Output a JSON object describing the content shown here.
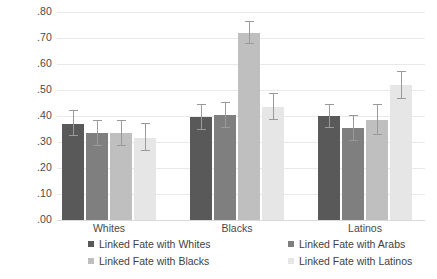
{
  "chart_data": {
    "type": "bar",
    "title": "",
    "subtitle": "",
    "xlabel": "",
    "ylabel": "",
    "ylim": [
      0.0,
      0.8
    ],
    "grid": true,
    "legend_position": "bottom",
    "categories": [
      "Whites",
      "Blacks",
      "Latinos"
    ],
    "ytick_labels": [
      ".80",
      ".70",
      ".60",
      ".50",
      ".40",
      ".30",
      ".20",
      ".10",
      ".00"
    ],
    "ytick_values": [
      0.8,
      0.7,
      0.6,
      0.5,
      0.4,
      0.3,
      0.2,
      0.1,
      0.0
    ],
    "series": [
      {
        "name": "Linked Fate with Whites",
        "color": "#595959",
        "values": [
          0.37,
          0.395,
          0.4
        ],
        "err_low": [
          0.325,
          0.345,
          0.355
        ],
        "err_high": [
          0.425,
          0.445,
          0.445
        ]
      },
      {
        "name": "Linked Fate with Arabs",
        "color": "#7f7f7f",
        "values": [
          0.335,
          0.405,
          0.355
        ],
        "err_low": [
          0.285,
          0.355,
          0.305
        ],
        "err_high": [
          0.385,
          0.455,
          0.405
        ]
      },
      {
        "name": "Linked Fate with Blacks",
        "color": "#bfbfbf",
        "values": [
          0.335,
          0.72,
          0.385
        ],
        "err_low": [
          0.285,
          0.675,
          0.325
        ],
        "err_high": [
          0.385,
          0.765,
          0.445
        ]
      },
      {
        "name": "Linked Fate with Latinos",
        "color": "#e6e6e6",
        "values": [
          0.315,
          0.435,
          0.52
        ],
        "err_low": [
          0.265,
          0.385,
          0.465
        ],
        "err_high": [
          0.375,
          0.49,
          0.575
        ]
      }
    ]
  },
  "legend": {
    "entries": [
      {
        "label": "Linked Fate with Whites",
        "color": "#595959"
      },
      {
        "label": "Linked Fate with Arabs",
        "color": "#7f7f7f"
      },
      {
        "label": "Linked Fate with Blacks",
        "color": "#bfbfbf"
      },
      {
        "label": "Linked Fate with Latinos",
        "color": "#e6e6e6"
      }
    ]
  },
  "axis": {
    "ytick_labels": [
      ".80",
      ".70",
      ".60",
      ".50",
      ".40",
      ".30",
      ".20",
      ".10",
      ".00"
    ],
    "category_labels": [
      "Whites",
      "Blacks",
      "Latinos"
    ]
  }
}
